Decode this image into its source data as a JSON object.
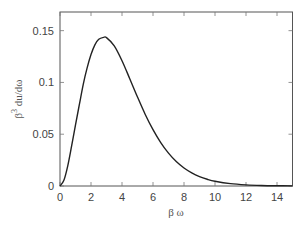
{
  "chart_data": {
    "type": "line",
    "title": "",
    "xlabel": "β ω",
    "ylabel_base": "β",
    "ylabel_sup": "3",
    "ylabel_rest": " du/dω",
    "xlim": [
      0,
      15
    ],
    "ylim": [
      0,
      0.168
    ],
    "grid": false,
    "legend": null,
    "xticks": [
      0,
      2,
      4,
      6,
      8,
      10,
      12,
      14
    ],
    "xtick_labels": [
      "0",
      "2",
      "4",
      "6",
      "8",
      "10",
      "12",
      "14"
    ],
    "yticks": [
      0,
      0.05,
      0.1,
      0.15
    ],
    "ytick_labels": [
      "0",
      "0.05",
      "0.1",
      "0.15"
    ],
    "series": [
      {
        "name": "Planck spectrum",
        "color": "#222222",
        "x": [
          0,
          0.25,
          0.5,
          0.75,
          1,
          1.25,
          1.5,
          1.75,
          2,
          2.25,
          2.5,
          2.82,
          3,
          3.5,
          4,
          4.5,
          5,
          5.5,
          6,
          6.5,
          7,
          7.5,
          8,
          8.5,
          9,
          9.5,
          10,
          11,
          12,
          13,
          14,
          15
        ],
        "y": [
          0,
          0.0055,
          0.0195,
          0.0387,
          0.059,
          0.0787,
          0.0982,
          0.114,
          0.1269,
          0.1363,
          0.1416,
          0.1435,
          0.1433,
          0.1353,
          0.121,
          0.1036,
          0.0859,
          0.0691,
          0.0544,
          0.0419,
          0.0317,
          0.0236,
          0.0174,
          0.0127,
          0.0091,
          0.0065,
          0.0046,
          0.00225,
          0.00108,
          0.0005,
          0.00023,
          0.0001
        ]
      }
    ]
  }
}
